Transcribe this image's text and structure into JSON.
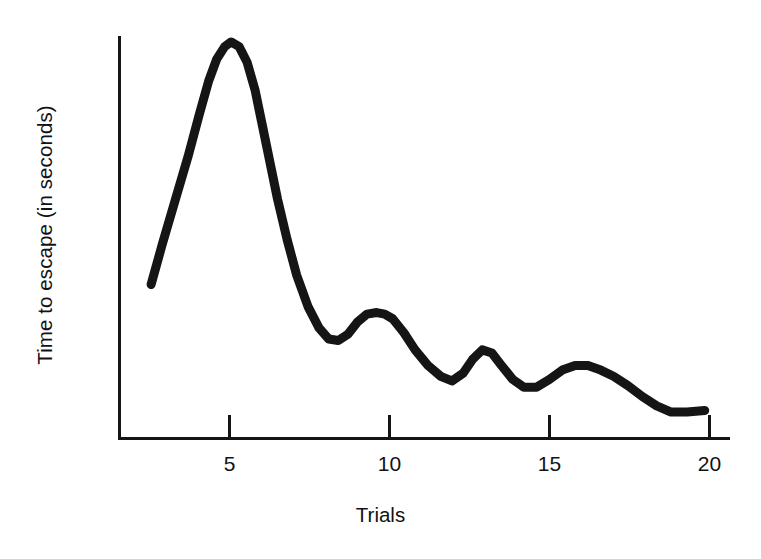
{
  "chart_data": {
    "type": "line",
    "title": "",
    "xlabel": "Trials",
    "ylabel": "Time to escape (in seconds)",
    "xlim": [
      2.5,
      20
    ],
    "ylim": [
      0,
      13
    ],
    "xticks": [
      5,
      10,
      15,
      20
    ],
    "xtick_labels": [
      "5",
      "10",
      "15",
      "20"
    ],
    "yticks": [],
    "ytick_labels": [],
    "grid": false,
    "legend": null,
    "line_color": "#151515",
    "line_width": 9,
    "axis_color": "#151515",
    "background": "#ffffff",
    "series": [
      {
        "name": "Time to escape",
        "x": [
          2.55,
          2.9,
          3.3,
          3.7,
          4.05,
          4.35,
          4.6,
          4.85,
          5.05,
          5.3,
          5.55,
          5.8,
          6.0,
          6.25,
          6.5,
          6.8,
          7.1,
          7.45,
          7.8,
          8.1,
          8.4,
          8.7,
          9.0,
          9.3,
          9.6,
          9.85,
          10.1,
          10.45,
          10.8,
          11.2,
          11.6,
          11.95,
          12.3,
          12.6,
          12.9,
          13.2,
          13.5,
          13.85,
          14.2,
          14.6,
          15.0,
          15.4,
          15.8,
          16.2,
          16.6,
          17.0,
          17.45,
          17.9,
          18.35,
          18.8,
          19.3,
          19.85
        ],
        "y": [
          4.95,
          6.25,
          7.65,
          9.05,
          10.4,
          11.5,
          12.2,
          12.6,
          12.75,
          12.6,
          12.1,
          11.2,
          10.2,
          8.95,
          7.7,
          6.4,
          5.25,
          4.25,
          3.55,
          3.2,
          3.15,
          3.35,
          3.75,
          4.0,
          4.05,
          4.0,
          3.85,
          3.4,
          2.85,
          2.35,
          2.0,
          1.85,
          2.1,
          2.55,
          2.85,
          2.75,
          2.35,
          1.9,
          1.65,
          1.65,
          1.9,
          2.2,
          2.35,
          2.35,
          2.2,
          2.0,
          1.7,
          1.35,
          1.05,
          0.85,
          0.85,
          0.9
        ],
        "annotations": [
          {
            "label": "peak",
            "x": 5.05,
            "y": 12.75
          },
          {
            "label": "first-local-min",
            "x": 8.4,
            "y": 3.15
          },
          {
            "label": "second-local-max",
            "x": 9.6,
            "y": 4.05
          },
          {
            "label": "second-local-min",
            "x": 11.6,
            "y": 1.85
          },
          {
            "label": "third-local-max",
            "x": 12.9,
            "y": 2.85
          },
          {
            "label": "third-local-min",
            "x": 14.25,
            "y": 1.63
          },
          {
            "label": "fourth-local-max",
            "x": 15.9,
            "y": 2.37
          },
          {
            "label": "tail-plateau",
            "x": 19.3,
            "y": 0.85
          }
        ]
      }
    ]
  },
  "axes": {
    "x_axis_label": "Trials",
    "y_axis_label": "Time to escape (in seconds)",
    "tick_labels": [
      "5",
      "10",
      "15",
      "20"
    ]
  }
}
